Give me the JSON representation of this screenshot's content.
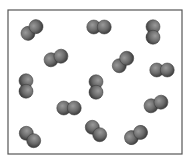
{
  "diagram": {
    "type": "particle-box",
    "container": {
      "x": 8,
      "y": 10,
      "width": 174,
      "height": 144,
      "stroke": "#555555"
    },
    "atom_color": "#6e6e6e",
    "atom_radius": 7,
    "molecules": [
      {
        "cx": 32,
        "cy": 30,
        "angle": -40
      },
      {
        "cx": 99,
        "cy": 27,
        "angle": 0
      },
      {
        "cx": 153,
        "cy": 32,
        "angle": 90
      },
      {
        "cx": 56,
        "cy": 58,
        "angle": -20
      },
      {
        "cx": 123,
        "cy": 62,
        "angle": -45
      },
      {
        "cx": 162,
        "cy": 70,
        "angle": 0
      },
      {
        "cx": 26,
        "cy": 86,
        "angle": 90
      },
      {
        "cx": 96,
        "cy": 87,
        "angle": 90
      },
      {
        "cx": 69,
        "cy": 108,
        "angle": 0
      },
      {
        "cx": 156,
        "cy": 104,
        "angle": -20
      },
      {
        "cx": 30,
        "cy": 137,
        "angle": 45
      },
      {
        "cx": 96,
        "cy": 131,
        "angle": 45
      },
      {
        "cx": 136,
        "cy": 135,
        "angle": -30
      }
    ],
    "molecule_count": 13
  }
}
